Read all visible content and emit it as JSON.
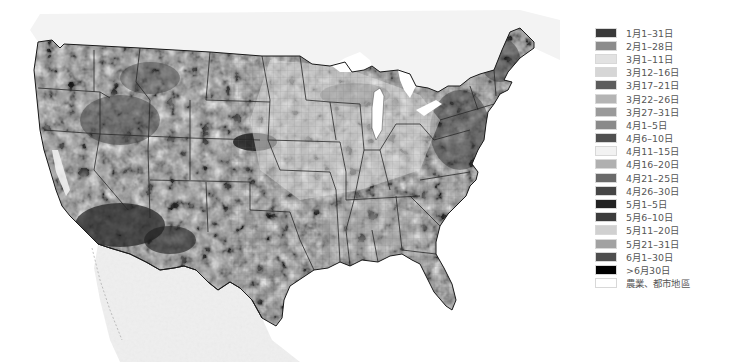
{
  "map": {
    "title": "",
    "background_fill": "#f1f1f1",
    "land_base": "#8e8e8e",
    "border_color": "#2a2a2a"
  },
  "legend": {
    "items": [
      {
        "label": "1月1–31日",
        "color": "#3a3a3a"
      },
      {
        "label": "2月1–28日",
        "color": "#8c8c8c"
      },
      {
        "label": "3月1–11日",
        "color": "#e2e2e2"
      },
      {
        "label": "3月12–16日",
        "color": "#d6d6d6"
      },
      {
        "label": "3月17–21日",
        "color": "#5c5c5c"
      },
      {
        "label": "3月22–26日",
        "color": "#b4b4b4"
      },
      {
        "label": "3月27–31日",
        "color": "#9a9a9a"
      },
      {
        "label": "4月1–5日",
        "color": "#8a8a8a"
      },
      {
        "label": "4月6–10日",
        "color": "#505050"
      },
      {
        "label": "4月11–15日",
        "color": "#f2f2f2"
      },
      {
        "label": "4月16–20日",
        "color": "#b0b0b0"
      },
      {
        "label": "4月21–25日",
        "color": "#6a6a6a"
      },
      {
        "label": "4月26–30日",
        "color": "#454545"
      },
      {
        "label": "5月1–5日",
        "color": "#222222"
      },
      {
        "label": "5月6–10日",
        "color": "#3c3c3c"
      },
      {
        "label": "5月11–20日",
        "color": "#d0d0d0"
      },
      {
        "label": "5月21–31日",
        "color": "#a2a2a2"
      },
      {
        "label": "6月1–30日",
        "color": "#4e4e4e"
      },
      {
        "label": ">6月30日",
        "color": "#000000"
      },
      {
        "label": "農業、都市地區",
        "color": "#ffffff"
      }
    ]
  }
}
